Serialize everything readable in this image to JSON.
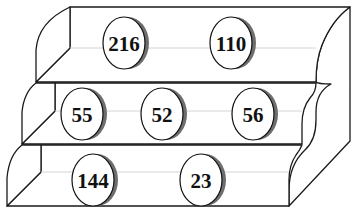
{
  "diagram": {
    "type": "stepped-shelf",
    "tiers": [
      {
        "name": "top",
        "discs": [
          {
            "label": "216",
            "cx": 124,
            "cy": 43
          },
          {
            "label": "110",
            "cx": 231,
            "cy": 43
          }
        ]
      },
      {
        "name": "middle",
        "discs": [
          {
            "label": "55",
            "cx": 82,
            "cy": 114
          },
          {
            "label": "52",
            "cx": 162,
            "cy": 114
          },
          {
            "label": "56",
            "cx": 253,
            "cy": 114
          }
        ]
      },
      {
        "name": "bottom",
        "discs": [
          {
            "label": "144",
            "cx": 93,
            "cy": 180
          },
          {
            "label": "23",
            "cx": 201,
            "cy": 180
          }
        ]
      }
    ],
    "colors": {
      "stroke": "#1a1a1a",
      "shadow": "#6e6e6e",
      "guide": "#d4d4d4",
      "background": "#ffffff"
    }
  }
}
